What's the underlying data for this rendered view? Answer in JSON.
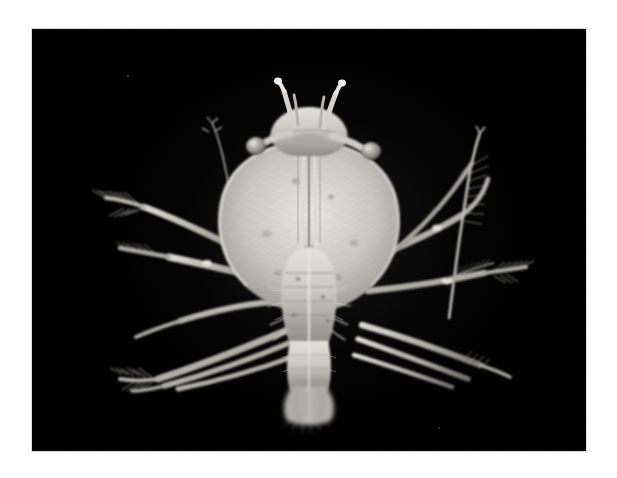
{
  "page": {
    "background_color": "#ffffff",
    "width": 617,
    "height": 478
  },
  "plate": {
    "name": "specimen-photomicrograph",
    "background_color": "#000000",
    "border_color": "#d9d9d9",
    "imaging_mode": "dark-field grayscale photomicrograph",
    "left": 32,
    "top": 29,
    "width": 554,
    "height": 422
  },
  "specimen": {
    "label": "crustacean specimen",
    "description": "Pale translucent shrimp-like crustacean photographed dorsally against a black background",
    "orientation": "dorsal view, head at top",
    "tone_light": "#f0efec",
    "tone_mid": "#b9b7b2",
    "tone_dark": "#6a6864",
    "parts": [
      {
        "name": "left-eye-stalk",
        "label": "left stalked eye"
      },
      {
        "name": "right-eye-stalk",
        "label": "right stalked eye"
      },
      {
        "name": "rostrum",
        "label": "rostrum"
      },
      {
        "name": "left-antennule",
        "label": "left antennule"
      },
      {
        "name": "right-antennule",
        "label": "right antennule"
      },
      {
        "name": "carapace",
        "label": "carapace shield"
      },
      {
        "name": "thorax",
        "label": "segmented thorax"
      },
      {
        "name": "abdomen",
        "label": "abdomen"
      },
      {
        "name": "telson",
        "label": "telson and uropod fan"
      },
      {
        "name": "left-walking-legs",
        "label": "left pereiopods"
      },
      {
        "name": "right-walking-legs",
        "label": "right pereiopods"
      },
      {
        "name": "left-antenna-flagellum",
        "label": "left antennal flagellum"
      },
      {
        "name": "right-antenna-flagellum",
        "label": "right antennal flagellum"
      },
      {
        "name": "setae",
        "label": "feathered setae on distal limb segments"
      }
    ]
  },
  "artifacts": {
    "specks": [
      {
        "x": 95,
        "y": 46
      },
      {
        "x": 406,
        "y": 398
      }
    ]
  }
}
